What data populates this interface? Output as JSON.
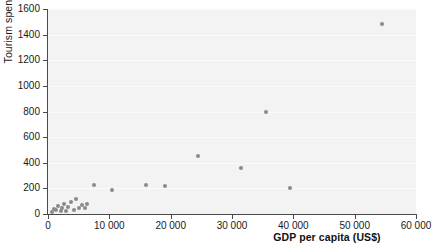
{
  "chart_data": {
    "type": "scatter",
    "title": "",
    "xlabel": "GDP per capita (US$)",
    "ylabel": "Tourism spending (US$)",
    "xlim": [
      0,
      60000
    ],
    "ylim": [
      0,
      1600
    ],
    "xticks": [
      0,
      10000,
      20000,
      30000,
      40000,
      50000,
      60000
    ],
    "xticklabels": [
      "0",
      "10 000",
      "20 000",
      "30 000",
      "40 000",
      "50 000",
      "60 000"
    ],
    "yticks": [
      0,
      200,
      400,
      600,
      800,
      1000,
      1200,
      1400,
      1600
    ],
    "yticklabels": [
      "0",
      "200",
      "400",
      "600",
      "800",
      "1000",
      "1200",
      "1400",
      "1600"
    ],
    "grid": "horizontal",
    "legend": "none",
    "marker_color": "#8a8a8a",
    "panel_color": "#f3f3f3",
    "points": [
      {
        "x": 600,
        "y": 15
      },
      {
        "x": 900,
        "y": 40
      },
      {
        "x": 1300,
        "y": 30
      },
      {
        "x": 1700,
        "y": 60
      },
      {
        "x": 2100,
        "y": 20
      },
      {
        "x": 2300,
        "y": 45
      },
      {
        "x": 2600,
        "y": 75
      },
      {
        "x": 2900,
        "y": 25
      },
      {
        "x": 3300,
        "y": 55
      },
      {
        "x": 3700,
        "y": 95
      },
      {
        "x": 4200,
        "y": 35
      },
      {
        "x": 4600,
        "y": 120
      },
      {
        "x": 5100,
        "y": 50
      },
      {
        "x": 5600,
        "y": 70
      },
      {
        "x": 6100,
        "y": 45
      },
      {
        "x": 6400,
        "y": 80
      },
      {
        "x": 7500,
        "y": 230
      },
      {
        "x": 10500,
        "y": 185
      },
      {
        "x": 16000,
        "y": 230
      },
      {
        "x": 19000,
        "y": 220
      },
      {
        "x": 24500,
        "y": 450
      },
      {
        "x": 31500,
        "y": 360
      },
      {
        "x": 35500,
        "y": 800
      },
      {
        "x": 39500,
        "y": 200
      },
      {
        "x": 54500,
        "y": 1480
      }
    ]
  }
}
